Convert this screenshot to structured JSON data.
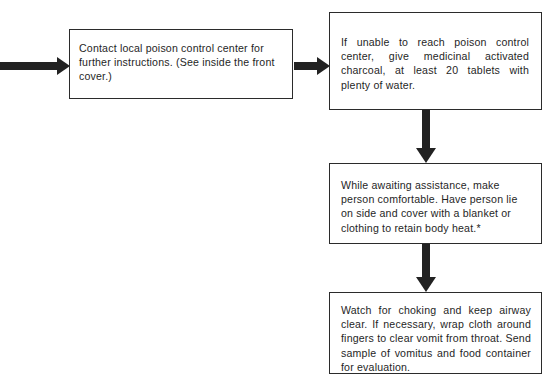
{
  "diagram": {
    "background_color": "#ffffff",
    "line_color": "#222222",
    "text_color": "#1f1f1f",
    "boxes": [
      {
        "id": "contact-poison-control",
        "text": "Contact local poison control center for further instructions. (See inside the front cover.)"
      },
      {
        "id": "activated-charcoal",
        "text": "If unable to reach poison control center, give medicinal activated charcoal, at least 20 tablets with plenty of water."
      },
      {
        "id": "await-assistance",
        "text": "While awaiting assistance, make person comfortable. Have person lie on side and cover with a blanket or clothing to retain body heat.*"
      },
      {
        "id": "watch-choking",
        "text": "Watch for choking and keep airway clear. If necessary, wrap cloth around fingers to clear vomit from throat. Send sample of vomitus and food container for evaluation."
      }
    ],
    "arrows": [
      {
        "id": "into-contact-box",
        "direction": "right"
      },
      {
        "id": "contact-to-charcoal",
        "direction": "right"
      },
      {
        "id": "charcoal-to-await",
        "direction": "down"
      },
      {
        "id": "await-to-watch",
        "direction": "down"
      }
    ]
  }
}
